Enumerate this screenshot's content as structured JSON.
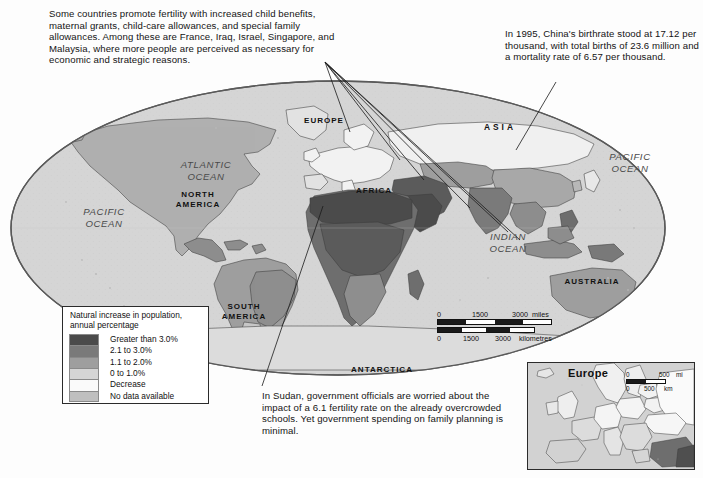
{
  "page": {
    "background_color": "#fdfdfd",
    "width": 703,
    "height": 478
  },
  "annotations": {
    "fertility_note": "Some countries promote fertility with increased child benefits, maternal grants, child-care allowances, and special family allowances. Among these are France, Iraq, Israel, Singapore, and Malaysia, where more people are perceived as necessary for economic and strategic reasons.",
    "china_note": "In 1995, China's birthrate stood at 17.12 per thousand, with total births of 23.6 million and a mortality rate of 6.57 per thousand.",
    "sudan_note": "In Sudan, government officials are worried about the impact of a 6.1 fertility rate on the already overcrowded schools. Yet government spending on family planning is minimal."
  },
  "legend": {
    "title": "Natural increase in population,\nannual percentage",
    "items": [
      {
        "label": "Greater than 3.0%",
        "color": "#4b4b4b"
      },
      {
        "label": "2.1 to 3.0%",
        "color": "#7a7a7a"
      },
      {
        "label": "1.1 to 2.0%",
        "color": "#9e9e9e"
      },
      {
        "label": "0 to 1.0%",
        "color": "#d5d5d5"
      },
      {
        "label": "Decrease",
        "color": "#fafafa"
      },
      {
        "label": "No data available",
        "color": "#bfbfbf"
      }
    ]
  },
  "map": {
    "projection": "elliptical",
    "ocean_color": "#d5d5d5",
    "outline_color": "#5a5a5a",
    "continent_labels": [
      {
        "text": "NORTH\nAMERICA",
        "x": 190,
        "y": 122
      },
      {
        "text": "SOUTH\nAMERICA",
        "x": 236,
        "y": 234
      },
      {
        "text": "EUROPE",
        "x": 314,
        "y": 119
      },
      {
        "text": "AFRICA",
        "x": 374,
        "y": 188
      },
      {
        "text": "ASIA",
        "x": 489,
        "y": 125
      },
      {
        "text": "AUSTRALIA",
        "x": 586,
        "y": 279
      },
      {
        "text": "ANTARCTICA",
        "x": 377,
        "y": 371
      }
    ],
    "ocean_labels": [
      {
        "text": "ATLANTIC\nOCEAN",
        "x": 196,
        "y": 163
      },
      {
        "text": "PACIFIC\nOCEAN",
        "x": 100,
        "y": 211
      },
      {
        "text": "PACIFIC\nOCEAN",
        "x": 628,
        "y": 157
      },
      {
        "text": "INDIAN\nOCEAN",
        "x": 504,
        "y": 238
      }
    ],
    "scale_bar": {
      "miles": {
        "ticks": [
          "0",
          "1500",
          "3000"
        ],
        "unit": "miles"
      },
      "kilometres": {
        "ticks": [
          "0",
          "1500",
          "3000"
        ],
        "unit": "kilometres"
      }
    }
  },
  "inset": {
    "title": "Europe",
    "scale_bar": {
      "miles": {
        "ticks": [
          "0",
          "500"
        ],
        "unit": "mi"
      },
      "km": {
        "ticks": [
          "0",
          "500"
        ],
        "unit": "km"
      }
    }
  }
}
